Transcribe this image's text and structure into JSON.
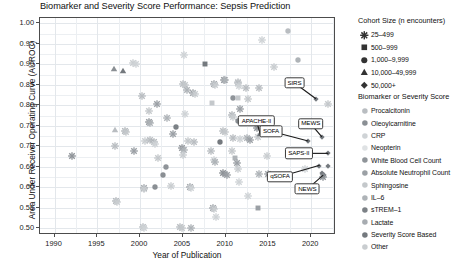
{
  "chart": {
    "title": "Biomarker and Severity Score Performance: Sepsis Prediction",
    "xlabel": "Year of Publication",
    "ylabel": "Area Under Receiver Operating Curve (AUROC)"
  },
  "axes": {
    "y_ticks": [
      "0.50",
      "0.55",
      "0.60",
      "0.65",
      "0.70",
      "0.75",
      "0.80",
      "0.85",
      "0.90",
      "0.95",
      "1.00"
    ],
    "x_ticks": [
      "1990",
      "1995",
      "2000",
      "2005",
      "2010",
      "2015",
      "2020"
    ]
  },
  "legend_size": {
    "title": "Cohort Size (n encounters)",
    "items": [
      {
        "label": "25–499",
        "marker": "asterisk"
      },
      {
        "label": "500–999",
        "marker": "square"
      },
      {
        "label": "1,000–9,999",
        "marker": "circle"
      },
      {
        "label": "10,000–49,999",
        "marker": "triangle"
      },
      {
        "label": "50,000+",
        "marker": "diamond"
      }
    ]
  },
  "legend_biomarker": {
    "title": "Biomarker or Severity Score",
    "items": [
      {
        "label": "Procalcitonin",
        "color": "#b9bdc1"
      },
      {
        "label": "Oleoylcarnitine",
        "color": "#8a8f94"
      },
      {
        "label": "CRP",
        "color": "#cfd3d6"
      },
      {
        "label": "Neopterin",
        "color": "#dfe2e4"
      },
      {
        "label": "White Blood Cell Count",
        "color": "#8f9499"
      },
      {
        "label": "Absolute Neutrophil Count",
        "color": "#9ba0a5"
      },
      {
        "label": "Sphingosine",
        "color": "#c4c8cb"
      },
      {
        "label": "IL–6",
        "color": "#aeb3b7"
      },
      {
        "label": "sTREM–1",
        "color": "#7c8186"
      },
      {
        "label": "Lactate",
        "color": "#a7acb1"
      },
      {
        "label": "Severity Score Based",
        "color": "#74797e"
      },
      {
        "label": "Other",
        "color": "#c9cdd0"
      }
    ]
  },
  "annotations": [
    {
      "label": "SIRS",
      "bx": 2018.05,
      "by": 0.8545,
      "tx": 2020.55,
      "ty": 0.816
    },
    {
      "label": "APACHE-II",
      "bx": 2013.6,
      "by": 0.762,
      "tx": 2014.05,
      "ty": 0.73
    },
    {
      "label": "SOFA",
      "bx": 2015.3,
      "by": 0.737,
      "tx": 2019.65,
      "ty": 0.713
    },
    {
      "label": "MEWS",
      "bx": 2019.95,
      "by": 0.755,
      "tx": 2021.25,
      "ty": 0.723
    },
    {
      "label": "SAPS-II",
      "bx": 2018.55,
      "by": 0.683,
      "tx": 2022.0,
      "ty": 0.683
    },
    {
      "label": "qSOFA",
      "bx": 2016.35,
      "by": 0.626,
      "tx": 2021.0,
      "ty": 0.654
    },
    {
      "label": "NEWS",
      "bx": 2019.55,
      "by": 0.596,
      "tx": 2021.4,
      "ty": 0.63
    }
  ],
  "chart_data": {
    "type": "scatter",
    "title": "Biomarker and Severity Score Performance: Sepsis Prediction",
    "xlabel": "Year of Publication",
    "ylabel": "Area Under Receiver Operating Curve (AUROC)",
    "xlim": [
      1988.3,
      2022.9
    ],
    "ylim": [
      0.484,
      1.013
    ],
    "grid": true,
    "legend_position": "right",
    "size_encoding": "marker shape = cohort size (n encounters)",
    "color_encoding": "marker fill = biomarker or severity score",
    "points": [
      {
        "x": 1992.0,
        "y": 0.677,
        "marker": "asterisk",
        "color": "#8f9499"
      },
      {
        "x": 1997.0,
        "y": 0.889,
        "marker": "triangle",
        "color": "#8a8f94"
      },
      {
        "x": 1998.0,
        "y": 0.883,
        "marker": "triangle",
        "color": "#74797e"
      },
      {
        "x": 1999.2,
        "y": 0.903,
        "marker": "asterisk",
        "color": "#c9cdd0"
      },
      {
        "x": 1999.5,
        "y": 0.902,
        "marker": "asterisk",
        "color": "#cfd3d6"
      },
      {
        "x": 1997.1,
        "y": 0.74,
        "marker": "triangle",
        "color": "#b9bdc1"
      },
      {
        "x": 1998.2,
        "y": 0.737,
        "marker": "asterisk",
        "color": "#aeb3b7"
      },
      {
        "x": 1998.3,
        "y": 0.735,
        "marker": "asterisk",
        "color": "#c4c8cb"
      },
      {
        "x": 1997.1,
        "y": 0.7,
        "marker": "asterisk",
        "color": "#b9bdc1"
      },
      {
        "x": 1999.3,
        "y": 0.689,
        "marker": "asterisk",
        "color": "#9ba0a5"
      },
      {
        "x": 1997.2,
        "y": 0.567,
        "marker": "asterisk",
        "color": "#aeb3b7"
      },
      {
        "x": 1997.3,
        "y": 0.564,
        "marker": "asterisk",
        "color": "#c9cdd0"
      },
      {
        "x": 2000.2,
        "y": 0.823,
        "marker": "asterisk",
        "color": "#b9bdc1"
      },
      {
        "x": 2001.0,
        "y": 0.787,
        "marker": "asterisk",
        "color": "#c4c8cb"
      },
      {
        "x": 2001.0,
        "y": 0.76,
        "marker": "asterisk",
        "color": "#8f9499"
      },
      {
        "x": 2001.2,
        "y": 0.757,
        "marker": "asterisk",
        "color": "#aeb3b7"
      },
      {
        "x": 2002.0,
        "y": 0.803,
        "marker": "asterisk",
        "color": "#9ba0a5"
      },
      {
        "x": 2000.6,
        "y": 0.712,
        "marker": "asterisk",
        "color": "#c9cdd0"
      },
      {
        "x": 2001.2,
        "y": 0.716,
        "marker": "asterisk",
        "color": "#b9bdc1"
      },
      {
        "x": 2001.6,
        "y": 0.71,
        "marker": "asterisk",
        "color": "#aeb3b7"
      },
      {
        "x": 2001.8,
        "y": 0.705,
        "marker": "asterisk",
        "color": "#cfd3d6"
      },
      {
        "x": 2002.1,
        "y": 0.672,
        "marker": "asterisk",
        "color": "#c4c8cb"
      },
      {
        "x": 2000.4,
        "y": 0.599,
        "marker": "asterisk",
        "color": "#9ba0a5"
      },
      {
        "x": 2000.5,
        "y": 0.597,
        "marker": "asterisk",
        "color": "#c9cdd0"
      },
      {
        "x": 2001.8,
        "y": 0.601,
        "marker": "circle",
        "color": "#8a8f94"
      },
      {
        "x": 2000.3,
        "y": 0.503,
        "marker": "asterisk",
        "color": "#b9bdc1"
      },
      {
        "x": 2000.4,
        "y": 0.502,
        "marker": "asterisk",
        "color": "#cfd3d6"
      },
      {
        "x": 2003.2,
        "y": 0.769,
        "marker": "asterisk",
        "color": "#aeb3b7"
      },
      {
        "x": 2003.8,
        "y": 0.731,
        "marker": "asterisk",
        "color": "#9ba0a5"
      },
      {
        "x": 2004.2,
        "y": 0.747,
        "marker": "circle",
        "color": "#7c8186"
      },
      {
        "x": 2003.0,
        "y": 0.651,
        "marker": "circle",
        "color": "#8f9499"
      },
      {
        "x": 2002.7,
        "y": 0.63,
        "marker": "circle",
        "color": "#8a8f94"
      },
      {
        "x": 2003.6,
        "y": 0.604,
        "marker": "asterisk",
        "color": "#c9cdd0"
      },
      {
        "x": 2005.1,
        "y": 0.922,
        "marker": "asterisk",
        "color": "#cfd3d6"
      },
      {
        "x": 2005.0,
        "y": 0.853,
        "marker": "asterisk",
        "color": "#b9bdc1"
      },
      {
        "x": 2005.3,
        "y": 0.849,
        "marker": "asterisk",
        "color": "#c4c8cb"
      },
      {
        "x": 2005.5,
        "y": 0.838,
        "marker": "asterisk",
        "color": "#aeb3b7"
      },
      {
        "x": 2006.2,
        "y": 0.83,
        "marker": "asterisk",
        "color": "#9ba0a5"
      },
      {
        "x": 2006.4,
        "y": 0.828,
        "marker": "asterisk",
        "color": "#c9cdd0"
      },
      {
        "x": 2005.2,
        "y": 0.78,
        "marker": "asterisk",
        "color": "#cfd3d6"
      },
      {
        "x": 2005.6,
        "y": 0.713,
        "marker": "asterisk",
        "color": "#c4c8cb"
      },
      {
        "x": 2006.3,
        "y": 0.71,
        "marker": "asterisk",
        "color": "#b9bdc1"
      },
      {
        "x": 2004.9,
        "y": 0.695,
        "marker": "asterisk",
        "color": "#8f9499"
      },
      {
        "x": 2005.1,
        "y": 0.691,
        "marker": "asterisk",
        "color": "#aeb3b7"
      },
      {
        "x": 2005.0,
        "y": 0.678,
        "marker": "asterisk",
        "color": "#c9cdd0"
      },
      {
        "x": 2005.8,
        "y": 0.601,
        "marker": "asterisk",
        "color": "#9ba0a5"
      },
      {
        "x": 2005.9,
        "y": 0.599,
        "marker": "asterisk",
        "color": "#cfd3d6"
      },
      {
        "x": 2004.7,
        "y": 0.503,
        "marker": "asterisk",
        "color": "#b9bdc1"
      },
      {
        "x": 2004.9,
        "y": 0.502,
        "marker": "asterisk",
        "color": "#c4c8cb"
      },
      {
        "x": 2005.9,
        "y": 0.502,
        "marker": "asterisk",
        "color": "#aeb3b7"
      },
      {
        "x": 2007.6,
        "y": 0.9,
        "marker": "square",
        "color": "#74797e"
      },
      {
        "x": 2008.6,
        "y": 0.851,
        "marker": "asterisk",
        "color": "#9ba0a5"
      },
      {
        "x": 2008.8,
        "y": 0.849,
        "marker": "asterisk",
        "color": "#c9cdd0"
      },
      {
        "x": 2008.4,
        "y": 0.807,
        "marker": "square",
        "color": "#c4c8cb"
      },
      {
        "x": 2008.3,
        "y": 0.688,
        "marker": "asterisk",
        "color": "#b9bdc1"
      },
      {
        "x": 2008.6,
        "y": 0.668,
        "marker": "asterisk",
        "color": "#cfd3d6"
      },
      {
        "x": 2008.7,
        "y": 0.663,
        "marker": "asterisk",
        "color": "#aeb3b7"
      },
      {
        "x": 2008.5,
        "y": 0.55,
        "marker": "asterisk",
        "color": "#9ba0a5"
      },
      {
        "x": 2008.6,
        "y": 0.548,
        "marker": "asterisk",
        "color": "#c9cdd0"
      },
      {
        "x": 2008.9,
        "y": 0.528,
        "marker": "asterisk",
        "color": "#cfd3d6"
      },
      {
        "x": 2009.8,
        "y": 0.863,
        "marker": "asterisk",
        "color": "#8f9499"
      },
      {
        "x": 2009.9,
        "y": 0.861,
        "marker": "asterisk",
        "color": "#aeb3b7"
      },
      {
        "x": 2009.7,
        "y": 0.738,
        "marker": "asterisk",
        "color": "#b9bdc1"
      },
      {
        "x": 2009.9,
        "y": 0.736,
        "marker": "asterisk",
        "color": "#c4c8cb"
      },
      {
        "x": 2009.3,
        "y": 0.711,
        "marker": "circle",
        "color": "#74797e"
      },
      {
        "x": 2009.7,
        "y": 0.635,
        "marker": "asterisk",
        "color": "#8a8f94"
      },
      {
        "x": 2009.9,
        "y": 0.633,
        "marker": "square",
        "color": "#8f9499"
      },
      {
        "x": 2010.1,
        "y": 0.631,
        "marker": "asterisk",
        "color": "#9ba0a5"
      },
      {
        "x": 2010.9,
        "y": 0.818,
        "marker": "circle",
        "color": "#8f9499"
      },
      {
        "x": 2011.4,
        "y": 0.858,
        "marker": "asterisk",
        "color": "#c9cdd0"
      },
      {
        "x": 2011.5,
        "y": 0.855,
        "marker": "asterisk",
        "color": "#b9bdc1"
      },
      {
        "x": 2011.6,
        "y": 0.847,
        "marker": "asterisk",
        "color": "#cfd3d6"
      },
      {
        "x": 2011.4,
        "y": 0.818,
        "marker": "square",
        "color": "#c4c8cb"
      },
      {
        "x": 2010.8,
        "y": 0.777,
        "marker": "asterisk",
        "color": "#aeb3b7"
      },
      {
        "x": 2010.9,
        "y": 0.772,
        "marker": "asterisk",
        "color": "#c9cdd0"
      },
      {
        "x": 2011.7,
        "y": 0.79,
        "marker": "asterisk",
        "color": "#9ba0a5"
      },
      {
        "x": 2011.4,
        "y": 0.763,
        "marker": "circle",
        "color": "#8a8f94"
      },
      {
        "x": 2010.9,
        "y": 0.72,
        "marker": "asterisk",
        "color": "#b9bdc1"
      },
      {
        "x": 2011.7,
        "y": 0.718,
        "marker": "asterisk",
        "color": "#cfd3d6"
      },
      {
        "x": 2010.7,
        "y": 0.69,
        "marker": "asterisk",
        "color": "#c4c8cb"
      },
      {
        "x": 2011.1,
        "y": 0.672,
        "marker": "square",
        "color": "#aeb3b7"
      },
      {
        "x": 2011.3,
        "y": 0.66,
        "marker": "asterisk",
        "color": "#9ba0a5"
      },
      {
        "x": 2011.5,
        "y": 0.646,
        "marker": "asterisk",
        "color": "#c9cdd0"
      },
      {
        "x": 2011.6,
        "y": 0.613,
        "marker": "asterisk",
        "color": "#cfd3d6"
      },
      {
        "x": 2012.4,
        "y": 0.843,
        "marker": "asterisk",
        "color": "#b9bdc1"
      },
      {
        "x": 2012.6,
        "y": 0.816,
        "marker": "asterisk",
        "color": "#c4c8cb"
      },
      {
        "x": 2012.5,
        "y": 0.72,
        "marker": "asterisk",
        "color": "#aeb3b7"
      },
      {
        "x": 2012.8,
        "y": 0.716,
        "marker": "asterisk",
        "color": "#9ba0a5"
      },
      {
        "x": 2012.6,
        "y": 0.578,
        "marker": "asterisk",
        "color": "#cfd3d6"
      },
      {
        "x": 2013.9,
        "y": 0.842,
        "marker": "asterisk",
        "color": "#b9bdc1"
      },
      {
        "x": 2013.7,
        "y": 0.744,
        "marker": "asterisk",
        "color": "#8f9499"
      },
      {
        "x": 2013.8,
        "y": 0.722,
        "marker": "asterisk",
        "color": "#c4c8cb"
      },
      {
        "x": 2014.05,
        "y": 0.73,
        "marker": "triangle",
        "color": "#74797e"
      },
      {
        "x": 2013.9,
        "y": 0.633,
        "marker": "asterisk",
        "color": "#aeb3b7"
      },
      {
        "x": 2013.8,
        "y": 0.551,
        "marker": "square",
        "color": "#9ba0a5"
      },
      {
        "x": 2014.2,
        "y": 0.96,
        "marker": "asterisk",
        "color": "#cfd3d6"
      },
      {
        "x": 2015.6,
        "y": 0.893,
        "marker": "asterisk",
        "color": "#c9cdd0"
      },
      {
        "x": 2017.3,
        "y": 0.982,
        "marker": "circle",
        "color": "#b9bdc1"
      },
      {
        "x": 2018.5,
        "y": 0.911,
        "marker": "circle",
        "color": "#aeb3b7"
      },
      {
        "x": 2020.55,
        "y": 0.816,
        "marker": "diamond",
        "color": "#74797e"
      },
      {
        "x": 2022.0,
        "y": 0.804,
        "marker": "asterisk",
        "color": "#c4c8cb"
      },
      {
        "x": 2019.65,
        "y": 0.713,
        "marker": "diamond",
        "color": "#74797e"
      },
      {
        "x": 2021.25,
        "y": 0.723,
        "marker": "diamond",
        "color": "#74797e"
      },
      {
        "x": 2022.0,
        "y": 0.683,
        "marker": "diamond",
        "color": "#74797e"
      },
      {
        "x": 2020.9,
        "y": 0.653,
        "marker": "diamond",
        "color": "#74797e"
      },
      {
        "x": 2022.0,
        "y": 0.652,
        "marker": "diamond",
        "color": "#74797e"
      },
      {
        "x": 2021.3,
        "y": 0.634,
        "marker": "diamond",
        "color": "#74797e"
      },
      {
        "x": 2021.5,
        "y": 0.63,
        "marker": "diamond",
        "color": "#74797e"
      },
      {
        "x": 2021.4,
        "y": 0.626,
        "marker": "asterisk",
        "color": "#8a8f94"
      },
      {
        "x": 2019.3,
        "y": 0.645,
        "marker": "asterisk",
        "color": "#cfd3d6"
      },
      {
        "x": 2014.8,
        "y": 0.677,
        "marker": "asterisk",
        "color": "#c9cdd0"
      },
      {
        "x": 2015.0,
        "y": 0.633,
        "marker": "asterisk",
        "color": "#9ba0a5"
      }
    ]
  }
}
